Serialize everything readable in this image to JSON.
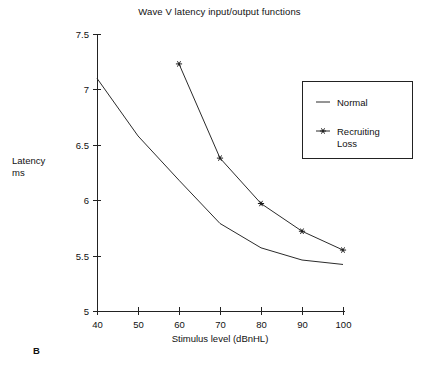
{
  "figure": {
    "panel_letter": "B",
    "title": "Wave V latency input/output functions",
    "ylabel_line1": "Latency",
    "ylabel_line2": "ms",
    "xlabel": "Stimulus level (dBnHL)",
    "line_color": "#2b2b2b",
    "axis_color": "#222222",
    "background": "#ffffff"
  },
  "legend": {
    "entries": [
      {
        "label": "Normal",
        "marker": "none"
      },
      {
        "label": "Recruiting",
        "label2": "Loss",
        "marker": "star"
      }
    ]
  },
  "chart_data": {
    "type": "line",
    "title": "Wave V latency input/output functions",
    "xlabel": "Stimulus level (dBnHL)",
    "ylabel": "Latency ms",
    "xlim": [
      40,
      100
    ],
    "ylim": [
      5,
      7.5
    ],
    "xticks": [
      40,
      50,
      60,
      70,
      80,
      90,
      100
    ],
    "yticks": [
      5,
      5.5,
      6,
      6.5,
      7,
      7.5
    ],
    "xtick_labels": [
      "40",
      "50",
      "60",
      "70",
      "80",
      "90",
      "100"
    ],
    "ytick_labels": [
      "5",
      "5.5",
      "6",
      "6.5",
      "7",
      "7.5"
    ],
    "grid": false,
    "legend_position": "upper right",
    "series": [
      {
        "name": "Normal",
        "marker": "none",
        "x": [
          40,
          50,
          60,
          70,
          80,
          90,
          100
        ],
        "values": [
          7.1,
          6.58,
          6.18,
          5.79,
          5.57,
          5.46,
          5.42
        ]
      },
      {
        "name": "Recruiting Loss",
        "marker": "star",
        "x": [
          60,
          70,
          80,
          90,
          100
        ],
        "values": [
          7.23,
          6.38,
          5.97,
          5.72,
          5.55
        ]
      }
    ]
  }
}
